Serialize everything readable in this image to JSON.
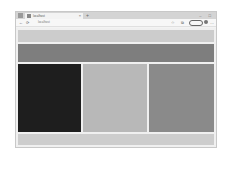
{
  "browser": {
    "tab": {
      "title": "localhost",
      "close_icon": "×"
    },
    "new_tab_icon": "+",
    "window_controls": "– □",
    "nav": {
      "back_icon": "←",
      "refresh_icon": "⟳"
    },
    "address_bar": {
      "url": "localhost"
    },
    "toolbar": {
      "star_icon": "☆",
      "extension_icon": "⧉",
      "profile_label": "",
      "menu_icon": "…"
    }
  },
  "page": {
    "colors": {
      "header": "#cccccc",
      "nav": "#7e7e7e",
      "column_left": "#1e1e1e",
      "column_middle": "#b8b8b8",
      "column_right": "#8a8a8a",
      "footer": "#cdcdcd"
    }
  },
  "caption": ""
}
